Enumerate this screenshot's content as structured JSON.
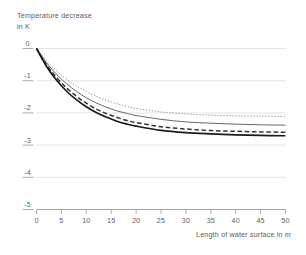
{
  "chart_data": {
    "type": "line",
    "title": "",
    "ylabel": "Temperature decrease in K",
    "ylabel_line1": "Temperature decrease",
    "ylabel_line2": "in K",
    "xlabel": "Length of water surface in m",
    "xlim": [
      0,
      50
    ],
    "ylim": [
      -5,
      0
    ],
    "xticks": [
      0,
      5,
      10,
      15,
      20,
      25,
      30,
      35,
      40,
      45,
      50
    ],
    "xtick_labels": [
      "0",
      "5",
      "10",
      "15",
      "20",
      "25",
      "30",
      "35",
      "40",
      "45",
      "50"
    ],
    "yticks": [
      0,
      -1,
      -2,
      -3,
      -4,
      -5
    ],
    "ytick_labels": [
      "0",
      "-1",
      "-2",
      "-3",
      "-4",
      "-5"
    ],
    "grid": true,
    "grid_color": "#d8d8d8",
    "axis_color": "#9a9a9a",
    "legend_position": "none",
    "x": [
      0,
      2,
      4,
      6,
      8,
      10,
      12,
      14,
      16,
      18,
      20,
      25,
      30,
      35,
      40,
      45,
      50
    ],
    "series": [
      {
        "name": "curve-dotted",
        "style": "dotted",
        "color": "#555555",
        "width": 0.9,
        "values": [
          0.0,
          -0.38,
          -0.69,
          -0.95,
          -1.16,
          -1.34,
          -1.49,
          -1.61,
          -1.71,
          -1.79,
          -1.86,
          -1.97,
          -2.03,
          -2.07,
          -2.09,
          -2.1,
          -2.11
        ]
      },
      {
        "name": "curve-thin-solid",
        "style": "solid",
        "color": "#555555",
        "width": 0.9,
        "values": [
          0.0,
          -0.44,
          -0.8,
          -1.09,
          -1.33,
          -1.53,
          -1.69,
          -1.82,
          -1.93,
          -2.01,
          -2.08,
          -2.2,
          -2.28,
          -2.32,
          -2.35,
          -2.37,
          -2.38
        ]
      },
      {
        "name": "curve-dashed",
        "style": "dashed",
        "color": "#333333",
        "width": 1.5,
        "values": [
          0.0,
          -0.5,
          -0.9,
          -1.22,
          -1.48,
          -1.7,
          -1.88,
          -2.02,
          -2.13,
          -2.23,
          -2.3,
          -2.43,
          -2.5,
          -2.55,
          -2.57,
          -2.59,
          -2.6
        ]
      },
      {
        "name": "curve-thick-solid",
        "style": "solid",
        "color": "#1a1a1a",
        "width": 1.7,
        "values": [
          0.0,
          -0.55,
          -0.98,
          -1.32,
          -1.59,
          -1.81,
          -1.99,
          -2.13,
          -2.25,
          -2.34,
          -2.41,
          -2.54,
          -2.61,
          -2.65,
          -2.68,
          -2.7,
          -2.71
        ]
      }
    ]
  }
}
